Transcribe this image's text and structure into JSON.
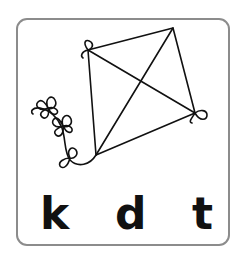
{
  "card": {
    "image": "kite-icon",
    "choices": [
      {
        "label": "k"
      },
      {
        "label": "d"
      },
      {
        "label": "t"
      }
    ]
  }
}
